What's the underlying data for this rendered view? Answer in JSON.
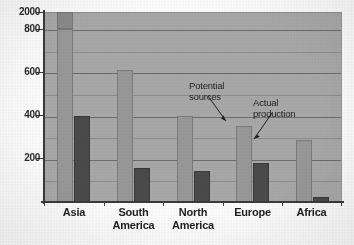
{
  "chart_data": {
    "type": "bar",
    "title": "",
    "subtitle": "",
    "xlabel": "",
    "ylabel": "",
    "categories": [
      "Asia",
      "South America",
      "North America",
      "Europe",
      "Africa"
    ],
    "series": [
      {
        "name": "Potential sources",
        "values": [
          2000,
          610,
          400,
          350,
          285
        ]
      },
      {
        "name": "Actual production",
        "values": [
          400,
          155,
          145,
          180,
          25
        ]
      }
    ],
    "ylim": [
      0,
      800
    ],
    "axis_break": {
      "note": "Y axis is broken: top tick reads 2000 directly above the 800 tick",
      "top_tick_value": 2000,
      "break_above": 800
    },
    "y_ticks_major": [
      800,
      600,
      400,
      200
    ],
    "y_tick_top": 2000,
    "y_ticks_minor": [
      700,
      500,
      300,
      100
    ],
    "grid": true,
    "legend": "none",
    "annotations": [
      {
        "text_line1": "Potential",
        "text_line2": "sources",
        "points_to": "Europe potential-sources bar top"
      },
      {
        "text_line1": "Actual",
        "text_line2": "production",
        "points_to": "Europe actual-production bar top"
      }
    ],
    "colors": {
      "plot_background": "#a9a9a9",
      "potential_bar": "#999999",
      "actual_bar": "#4b4b4b",
      "gridline": "#6e6e6e",
      "axis": "#3b3b3b",
      "page_background": "#fdfdfd",
      "text": "#1f1f1f"
    }
  },
  "y_axis": {
    "labels": [
      "2000",
      "800",
      "600",
      "400",
      "200"
    ]
  },
  "x_axis": {
    "labels": [
      {
        "line1": "Asia",
        "line2": ""
      },
      {
        "line1": "South",
        "line2": "America"
      },
      {
        "line1": "North",
        "line2": "America"
      },
      {
        "line1": "Europe",
        "line2": ""
      },
      {
        "line1": "Africa",
        "line2": ""
      }
    ]
  },
  "annotations": {
    "potential": {
      "line1": "Potential",
      "line2": "sources"
    },
    "actual": {
      "line1": "Actual",
      "line2": "production"
    }
  }
}
